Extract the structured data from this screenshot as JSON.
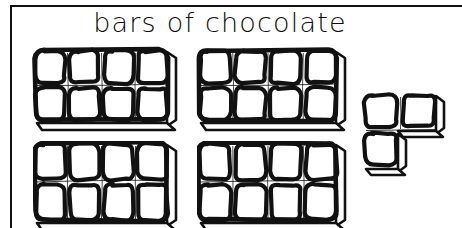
{
  "figure": {
    "title": "bars of chocolate",
    "kind": "hand-drawn-illustration",
    "background_color": "#ffffff",
    "ink_color": "#111111",
    "frame": {
      "top_border": true,
      "left_border": true,
      "right_border": false,
      "bottom_border": false
    }
  },
  "quantity": {
    "full_bars": 4,
    "pieces_per_bar": 8,
    "bar_grid_columns": 4,
    "bar_grid_rows": 2,
    "leftover_pieces": 3,
    "leftover_shape": "L-tromino",
    "total_pieces": 35
  },
  "items": [
    {
      "name": "bar-1",
      "label": "whole chocolate bar",
      "columns": 4,
      "rows": 2,
      "pieces": 8,
      "x": 33,
      "y": 48,
      "width": 148,
      "height": 80
    },
    {
      "name": "bar-2",
      "label": "whole chocolate bar",
      "columns": 4,
      "rows": 2,
      "pieces": 8,
      "x": 197,
      "y": 48,
      "width": 153,
      "height": 80
    },
    {
      "name": "bar-3",
      "label": "whole chocolate bar",
      "columns": 4,
      "rows": 2,
      "pieces": 8,
      "x": 33,
      "y": 141,
      "width": 148,
      "height": 87
    },
    {
      "name": "bar-4",
      "label": "whole chocolate bar",
      "columns": 4,
      "rows": 2,
      "pieces": 8,
      "x": 197,
      "y": 141,
      "width": 153,
      "height": 87
    },
    {
      "name": "leftover-piece",
      "label": "L-shaped leftover of three squares",
      "pieces": 3,
      "x": 362,
      "y": 92,
      "width": 80,
      "height": 82
    }
  ]
}
